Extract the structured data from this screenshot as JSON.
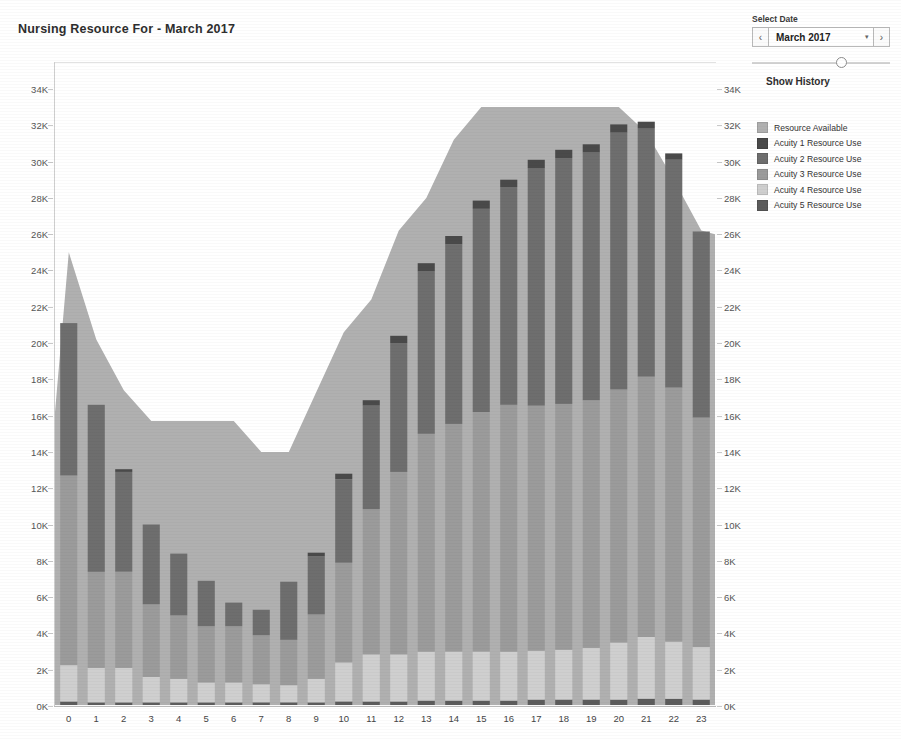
{
  "chart_title": "Nursing Resource For - March 2017",
  "controls": {
    "select_date_label": "Select Date",
    "prev_label": "‹",
    "next_label": "›",
    "date_value": "March 2017",
    "caret": "▾",
    "show_history_label": "Show History",
    "slider_value_pct": 65
  },
  "legend": {
    "items": [
      {
        "label": "Resource Available",
        "color": "#b0b0b0"
      },
      {
        "label": "Acuity 1 Resource Use",
        "color": "#4a4a4a"
      },
      {
        "label": "Acuity 2 Resource Use",
        "color": "#6e6e6e"
      },
      {
        "label": "Acuity 3 Resource Use",
        "color": "#9b9b9b"
      },
      {
        "label": "Acuity 4 Resource Use",
        "color": "#cfcfcf"
      },
      {
        "label": "Acuity 5 Resource Use",
        "color": "#5c5c5c"
      }
    ]
  },
  "chart_data": {
    "type": "bar",
    "title": "Nursing Resource For - March 2017",
    "xlabel": "",
    "ylabel": "",
    "ylim": [
      0,
      35000
    ],
    "grid": false,
    "legend_position": "right",
    "stacked": true,
    "x": [
      0,
      1,
      2,
      3,
      4,
      5,
      6,
      7,
      8,
      9,
      10,
      11,
      12,
      13,
      14,
      15,
      16,
      17,
      18,
      19,
      20,
      21,
      22,
      23
    ],
    "categories": [
      "0",
      "1",
      "2",
      "3",
      "4",
      "5",
      "6",
      "7",
      "8",
      "9",
      "10",
      "11",
      "12",
      "13",
      "14",
      "15",
      "16",
      "17",
      "18",
      "19",
      "20",
      "21",
      "22",
      "23"
    ],
    "y_ticks": [
      0,
      2000,
      4000,
      6000,
      8000,
      10000,
      12000,
      14000,
      16000,
      18000,
      20000,
      22000,
      24000,
      26000,
      28000,
      30000,
      32000,
      34000
    ],
    "y_tick_labels": [
      "0K",
      "2K",
      "4K",
      "6K",
      "8K",
      "10K",
      "12K",
      "14K",
      "16K",
      "18K",
      "20K",
      "22K",
      "24K",
      "26K",
      "28K",
      "30K",
      "32K",
      "34K"
    ],
    "series": [
      {
        "name": "Acuity 1 Resource Use",
        "color": "#4a4a4a",
        "values": [
          0,
          0,
          150,
          0,
          0,
          0,
          0,
          0,
          0,
          200,
          300,
          300,
          400,
          450,
          450,
          450,
          400,
          450,
          450,
          450,
          450,
          350,
          350,
          0
        ]
      },
      {
        "name": "Acuity 2 Resource Use",
        "color": "#6e6e6e",
        "values": [
          8400,
          9200,
          5500,
          4400,
          3400,
          2500,
          1300,
          1400,
          3200,
          3200,
          4600,
          5700,
          7100,
          8950,
          9900,
          11200,
          12000,
          13100,
          13550,
          13650,
          14150,
          13700,
          12550,
          10250
        ]
      },
      {
        "name": "Acuity 3 Resource Use",
        "color": "#9b9b9b",
        "values": [
          10450,
          5300,
          5300,
          4000,
          3500,
          3100,
          3100,
          2700,
          2500,
          3550,
          5500,
          8000,
          10050,
          12000,
          12550,
          13200,
          13600,
          13500,
          13550,
          13650,
          13950,
          14350,
          14000,
          12650
        ]
      },
      {
        "name": "Acuity 4 Resource Use",
        "color": "#cfcfcf",
        "values": [
          2000,
          1900,
          1900,
          1400,
          1300,
          1100,
          1100,
          1000,
          950,
          1300,
          2150,
          2600,
          2600,
          2700,
          2700,
          2700,
          2700,
          2700,
          2750,
          2850,
          3150,
          3400,
          3150,
          2900
        ]
      },
      {
        "name": "Acuity 5 Resource Use",
        "color": "#5c5c5c",
        "values": [
          250,
          200,
          200,
          200,
          200,
          200,
          200,
          200,
          200,
          200,
          250,
          250,
          250,
          300,
          300,
          300,
          300,
          350,
          350,
          350,
          350,
          400,
          400,
          350
        ]
      }
    ],
    "area_series": {
      "name": "Resource Available",
      "color": "#b0b0b0",
      "values": [
        25000,
        20200,
        17400,
        15700,
        15700,
        15700,
        15700,
        14000,
        14000,
        17300,
        20600,
        22400,
        26200,
        28000,
        31200,
        33000,
        33000,
        33000,
        33000,
        33000,
        33000,
        31600,
        29000,
        26200
      ],
      "edge_start_value": 16200,
      "edge_end_value": 26000
    }
  }
}
